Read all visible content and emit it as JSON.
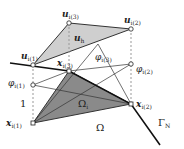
{
  "figure": {
    "labels": {
      "u1": "u",
      "u1_sub": "i(1)",
      "u2": "u",
      "u2_sub": "i(2)",
      "u3": "u",
      "u3_sub": "i(3)",
      "uh": "u",
      "uh_sub": "h",
      "x1": "x",
      "x1_sub": "i(1)",
      "x2": "x",
      "x2_sub": "i(2)",
      "x3": "x",
      "x3_sub": "i(3)",
      "phi1": "φ",
      "phi1_sub": "i(1)",
      "phi2": "φ",
      "phi2_sub": "i(2)",
      "phi3": "φ",
      "phi3_sub": "i(3)",
      "one": "1",
      "omega_i": "Ω",
      "omega_i_sub": "i",
      "omega": "Ω",
      "gamma_n": "Γ",
      "gamma_n_sub": "N"
    },
    "colors": {
      "upper_triangle_fill": "#cfcfcf",
      "lower_triangle_fill": "#8a8a8a",
      "line": "#333333",
      "boundary": "#111111",
      "dashed": "#999999"
    }
  }
}
